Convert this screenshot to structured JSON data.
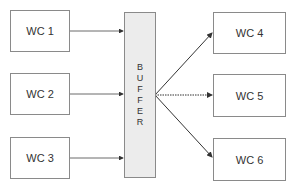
{
  "diagram": {
    "inputs": [
      {
        "label": "WC 1"
      },
      {
        "label": "WC 2"
      },
      {
        "label": "WC 3"
      }
    ],
    "buffer": {
      "label": "BUFFER",
      "letters": [
        "B",
        "U",
        "F",
        "F",
        "E",
        "R"
      ]
    },
    "outputs": [
      {
        "label": "WC 4"
      },
      {
        "label": "WC 5"
      },
      {
        "label": "WC 6"
      }
    ],
    "colors": {
      "border": "#8a8a8a",
      "buffer_fill": "#ececec",
      "arrow": "#333333"
    }
  }
}
